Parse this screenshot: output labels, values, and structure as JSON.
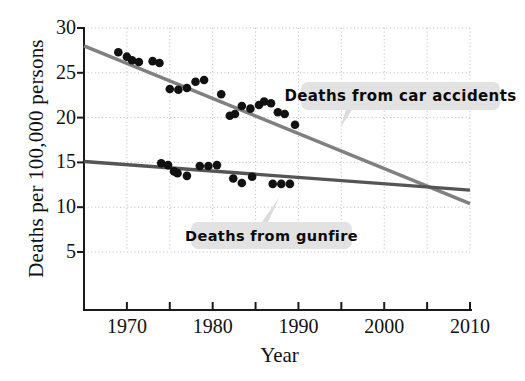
{
  "chart_data": {
    "type": "scatter",
    "title": "",
    "xlabel": "Year",
    "ylabel": "Deaths per 100,000 persons",
    "xlim": [
      1965,
      2010
    ],
    "ylim": [
      0,
      30
    ],
    "xticks": [
      1970,
      1980,
      1990,
      2000,
      2010
    ],
    "xticks_minor": [
      1975,
      1985,
      1995,
      2005
    ],
    "yticks": [
      5,
      10,
      15,
      20,
      25,
      30
    ],
    "grid": true,
    "legend_position": "inline-annotations",
    "series": [
      {
        "name": "Deaths from car accidents",
        "color": "#808080",
        "marker_color": "#111111",
        "points": [
          {
            "x": 1969,
            "y": 27.3
          },
          {
            "x": 1970,
            "y": 26.8
          },
          {
            "x": 1970.6,
            "y": 26.4
          },
          {
            "x": 1971.4,
            "y": 26.2
          },
          {
            "x": 1973,
            "y": 26.3
          },
          {
            "x": 1973.8,
            "y": 26.1
          },
          {
            "x": 1975,
            "y": 23.2
          },
          {
            "x": 1976,
            "y": 23.1
          },
          {
            "x": 1977,
            "y": 23.3
          },
          {
            "x": 1978,
            "y": 24.0
          },
          {
            "x": 1979,
            "y": 24.2
          },
          {
            "x": 1981,
            "y": 22.6
          },
          {
            "x": 1982,
            "y": 20.2
          },
          {
            "x": 1982.6,
            "y": 20.4
          },
          {
            "x": 1983.4,
            "y": 21.3
          },
          {
            "x": 1984.4,
            "y": 21.0
          },
          {
            "x": 1985.4,
            "y": 21.4
          },
          {
            "x": 1986,
            "y": 21.8
          },
          {
            "x": 1986.8,
            "y": 21.6
          },
          {
            "x": 1987.6,
            "y": 20.6
          },
          {
            "x": 1988.4,
            "y": 20.4
          },
          {
            "x": 1989.6,
            "y": 19.2
          }
        ],
        "fit_line": {
          "x1": 1965,
          "y1": 28.0,
          "x2": 2010,
          "y2": 10.4
        }
      },
      {
        "name": "Deaths from gunfire",
        "color": "#555555",
        "marker_color": "#111111",
        "points": [
          {
            "x": 1974,
            "y": 14.9
          },
          {
            "x": 1974.8,
            "y": 14.7
          },
          {
            "x": 1975.5,
            "y": 14.0
          },
          {
            "x": 1975.9,
            "y": 13.8
          },
          {
            "x": 1977,
            "y": 13.5
          },
          {
            "x": 1978.5,
            "y": 14.6
          },
          {
            "x": 1979.5,
            "y": 14.6
          },
          {
            "x": 1980.5,
            "y": 14.7
          },
          {
            "x": 1982.4,
            "y": 13.2
          },
          {
            "x": 1983.4,
            "y": 12.7
          },
          {
            "x": 1984.6,
            "y": 13.4
          },
          {
            "x": 1987,
            "y": 12.6
          },
          {
            "x": 1988,
            "y": 12.6
          },
          {
            "x": 1989,
            "y": 12.6
          }
        ],
        "fit_line": {
          "x1": 1965,
          "y1": 15.1,
          "x2": 2010,
          "y2": 11.9
        }
      }
    ],
    "annotations": [
      {
        "label": "Deaths from car accidents"
      },
      {
        "label": "Deaths from gunfire"
      }
    ]
  },
  "axis": {
    "ylabel": "Deaths per 100,000 persons",
    "xlabel": "Year",
    "yticks": [
      "30",
      "25",
      "20",
      "15",
      "10",
      "5"
    ],
    "xticks": [
      "1970",
      "1980",
      "1990",
      "2000",
      "2010"
    ]
  },
  "annotations": {
    "car": "Deaths from car accidents",
    "gunfire": "Deaths from gunfire"
  },
  "colors": {
    "car_line": "#808080",
    "gunfire_line": "#555555",
    "marker": "#111111",
    "grid": "#b9b9b9",
    "callout_bg": "#e2e2e2",
    "axis": "#1a1a1a"
  }
}
